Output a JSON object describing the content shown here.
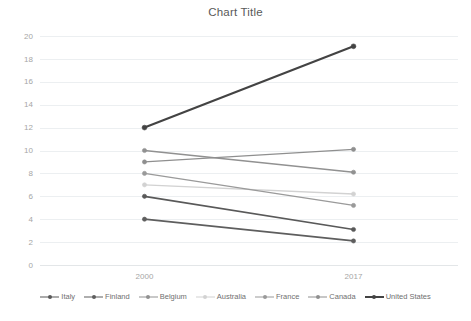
{
  "chart_data": {
    "type": "line",
    "title": "Chart Title",
    "xlabel": "",
    "ylabel": "",
    "categories": [
      "2000",
      "2017"
    ],
    "x": [
      "2000",
      "2017"
    ],
    "ylim": [
      0,
      20
    ],
    "ytick_step": 2,
    "yticks": [
      "20",
      "18",
      "16",
      "14",
      "12",
      "10",
      "8",
      "6",
      "4",
      "2",
      "0"
    ],
    "grid": true,
    "legend_position": "bottom",
    "series": [
      {
        "name": "Italy",
        "values": [
          6,
          3.1
        ],
        "color": "#595959",
        "width": 1.7,
        "marker": "circle"
      },
      {
        "name": "Finland",
        "values": [
          4,
          2.1
        ],
        "color": "#5e5e5e",
        "width": 1.7,
        "marker": "circle"
      },
      {
        "name": "Belgium",
        "values": [
          10,
          8.1
        ],
        "color": "#919191",
        "width": 1.3,
        "marker": "circle"
      },
      {
        "name": "Australia",
        "values": [
          7,
          6.2
        ],
        "color": "#d2d2d2",
        "width": 1.3,
        "marker": "circle"
      },
      {
        "name": "France",
        "values": [
          8,
          5.2
        ],
        "color": "#9a9a9a",
        "width": 1.3,
        "marker": "circle"
      },
      {
        "name": "Canada",
        "values": [
          9,
          10.1
        ],
        "color": "#8f8f8f",
        "width": 1.3,
        "marker": "circle"
      },
      {
        "name": "United States",
        "values": [
          12,
          19.1
        ],
        "color": "#434343",
        "width": 2.1,
        "marker": "circle"
      }
    ]
  },
  "legend": {
    "items": [
      {
        "label": "Italy"
      },
      {
        "label": "Finland"
      },
      {
        "label": "Belgium"
      },
      {
        "label": "Australia"
      },
      {
        "label": "France"
      },
      {
        "label": "Canada"
      },
      {
        "label": "United States"
      }
    ]
  },
  "colors": {
    "background": "#ffffff",
    "gridline": "#eceff1",
    "tick_text": "#a6a6a6",
    "title_text": "#595959"
  }
}
